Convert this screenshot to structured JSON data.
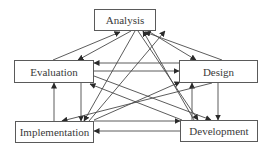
{
  "diagram": {
    "type": "process-cycle",
    "nodes": [
      {
        "id": "analysis",
        "label": "Analysis",
        "x": 94,
        "y": 9,
        "w": 62,
        "h": 22
      },
      {
        "id": "evaluation",
        "label": "Evaluation",
        "x": 14,
        "y": 60,
        "w": 80,
        "h": 23
      },
      {
        "id": "design",
        "label": "Design",
        "x": 179,
        "y": 60,
        "w": 79,
        "h": 23
      },
      {
        "id": "implementation",
        "label": "Implementation",
        "x": 15,
        "y": 121,
        "w": 79,
        "h": 22
      },
      {
        "id": "development",
        "label": "Development",
        "x": 180,
        "y": 120,
        "w": 78,
        "h": 22
      }
    ],
    "edges": [
      {
        "from": "evaluation",
        "to": "analysis",
        "x1": 53,
        "y1": 60,
        "x2": 120,
        "y2": 32
      },
      {
        "from": "analysis",
        "to": "evaluation",
        "x1": 131,
        "y1": 31,
        "x2": 78,
        "y2": 60
      },
      {
        "from": "analysis",
        "to": "design",
        "x1": 148,
        "y1": 31,
        "x2": 196,
        "y2": 60
      },
      {
        "from": "design",
        "to": "analysis",
        "x1": 222,
        "y1": 60,
        "x2": 145,
        "y2": 32
      },
      {
        "from": "design",
        "to": "evaluation",
        "x1": 179,
        "y1": 63,
        "x2": 94,
        "y2": 63
      },
      {
        "from": "evaluation",
        "to": "design",
        "x1": 94,
        "y1": 71,
        "x2": 179,
        "y2": 71
      },
      {
        "from": "implementation",
        "to": "evaluation",
        "x1": 54,
        "y1": 121,
        "x2": 54,
        "y2": 83
      },
      {
        "from": "evaluation",
        "to": "implementation",
        "x1": 81,
        "y1": 83,
        "x2": 81,
        "y2": 121
      },
      {
        "from": "design",
        "to": "development",
        "x1": 218,
        "y1": 83,
        "x2": 218,
        "y2": 120
      },
      {
        "from": "development",
        "to": "design",
        "x1": 192,
        "y1": 120,
        "x2": 192,
        "y2": 83
      },
      {
        "from": "implementation",
        "to": "development",
        "x1": 94,
        "y1": 121,
        "x2": 180,
        "y2": 121
      },
      {
        "from": "development",
        "to": "implementation",
        "x1": 180,
        "y1": 131,
        "x2": 94,
        "y2": 131
      },
      {
        "from": "analysis",
        "to": "implementation",
        "x1": 135,
        "y1": 31,
        "x2": 84,
        "y2": 121
      },
      {
        "from": "implementation",
        "to": "analysis",
        "x1": 89,
        "y1": 121,
        "x2": 165,
        "y2": 31
      },
      {
        "from": "analysis",
        "to": "development",
        "x1": 138,
        "y1": 31,
        "x2": 198,
        "y2": 120
      },
      {
        "from": "development",
        "to": "analysis",
        "x1": 194,
        "y1": 120,
        "x2": 143,
        "y2": 31
      },
      {
        "from": "evaluation",
        "to": "development",
        "x1": 94,
        "y1": 76,
        "x2": 211,
        "y2": 120
      },
      {
        "from": "development",
        "to": "evaluation",
        "x1": 182,
        "y1": 120,
        "x2": 90,
        "y2": 84
      },
      {
        "from": "design",
        "to": "implementation",
        "x1": 212,
        "y1": 83,
        "x2": 62,
        "y2": 121
      },
      {
        "from": "implementation",
        "to": "design",
        "x1": 94,
        "y1": 120,
        "x2": 180,
        "y2": 82
      }
    ],
    "colors": {
      "line": "#4a4a4a",
      "border": "#5a5a5a",
      "text": "#3a3a3a",
      "background": "#ffffff"
    }
  }
}
